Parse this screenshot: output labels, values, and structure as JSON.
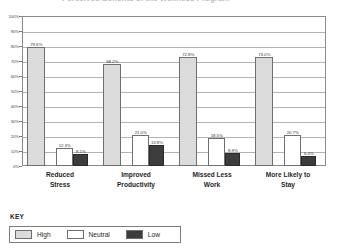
{
  "chart_data": {
    "type": "bar",
    "title": "Perceived Benefits of the Wellness Program",
    "xlabel": "",
    "ylabel": "",
    "ylim": [
      0,
      100
    ],
    "ytick_labels": [
      "100%",
      "90%",
      "80%",
      "70%",
      "60%",
      "50%",
      "40%",
      "30%",
      "20%",
      "10%",
      "0%"
    ],
    "ytick_values": [
      100,
      90,
      80,
      70,
      60,
      50,
      40,
      30,
      20,
      10,
      0
    ],
    "grid": true,
    "legend_position": "bottom-left",
    "categories": [
      "Reduced Stress",
      "Improved Productivity",
      "Missed Less Work",
      "More Likely to Stay"
    ],
    "category_lines": [
      [
        "Reduced",
        "Stress"
      ],
      [
        "Improved",
        "Productivity"
      ],
      [
        "Missed Less",
        "Work"
      ],
      [
        "More Likely to",
        "Stay"
      ]
    ],
    "series": [
      {
        "name": "High",
        "color": "#dcdcdc",
        "values": [
          79.6,
          68.2,
          72.8,
          73.0
        ],
        "labels": [
          "79.6%",
          "68.2%",
          "72.8%",
          "73.0%"
        ]
      },
      {
        "name": "Neutral",
        "color": "#ffffff",
        "values": [
          12.3,
          21.0,
          18.5,
          20.7
        ],
        "labels": [
          "12.3%",
          "21.0%",
          "18.5%",
          "20.7%"
        ]
      },
      {
        "name": "Low",
        "color": "#3d3d3d",
        "values": [
          8.1,
          13.8,
          8.9,
          6.4
        ],
        "labels": [
          "8.1%",
          "13.8%",
          "8.9%",
          "6.4%"
        ]
      }
    ]
  },
  "key": {
    "title": "KEY",
    "items": [
      {
        "label": "High",
        "color": "#dcdcdc"
      },
      {
        "label": "Neutral",
        "color": "#ffffff"
      },
      {
        "label": "Low",
        "color": "#3d3d3d"
      }
    ]
  }
}
